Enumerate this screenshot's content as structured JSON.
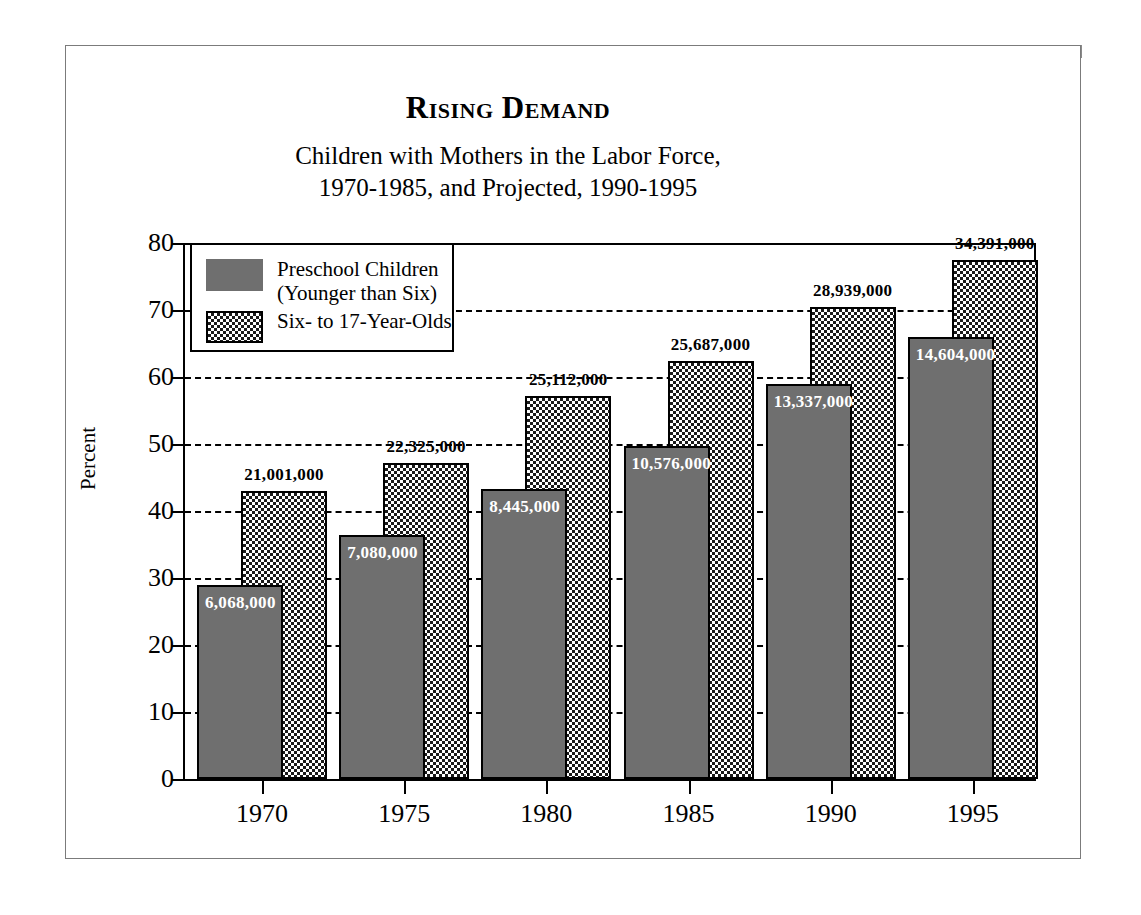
{
  "header": {
    "title": "Rising Demand",
    "subtitle_line1": "Children with Mothers in the Labor Force,",
    "subtitle_line2": "1970-1985, and Projected, 1990-1995"
  },
  "legend": {
    "items": [
      {
        "label": "Preschool Children\n(Younger than Six)",
        "swatch": "solid-gray-swatch",
        "color": "#6f6f6f"
      },
      {
        "label": "Six- to 17-Year-Olds",
        "swatch": "checkered-swatch",
        "color": "#1a1a1a"
      }
    ]
  },
  "axes": {
    "ylabel": "Percent",
    "yticks": [
      "0",
      "10",
      "20",
      "30",
      "40",
      "50",
      "60",
      "70",
      "80"
    ],
    "xticks": [
      "1970",
      "1975",
      "1980",
      "1985",
      "1990",
      "1995"
    ]
  },
  "chart_data": {
    "type": "bar",
    "title": "Rising Demand",
    "subtitle": "Children with Mothers in the Labor Force, 1970-1985, and Projected, 1990-1995",
    "xlabel": "",
    "ylabel": "Percent",
    "ylim": [
      0,
      80
    ],
    "yticks": [
      0,
      10,
      20,
      30,
      40,
      50,
      60,
      70,
      80
    ],
    "grid": true,
    "legend_position": "inside-top-left",
    "categories": [
      "1970",
      "1975",
      "1980",
      "1985",
      "1990",
      "1995"
    ],
    "series": [
      {
        "name": "Preschool Children (Younger than Six)",
        "style": "solid-gray",
        "color": "#6f6f6f",
        "values": [
          29.0,
          36.4,
          43.3,
          49.7,
          59.0,
          66.0
        ],
        "labels": [
          "6,068,000",
          "7,080,000",
          "8,445,000",
          "10,576,000",
          "13,337,000",
          "14,604,000"
        ],
        "label_position": "inside-top",
        "label_color": "#ffffff"
      },
      {
        "name": "Six- to 17-Year-Olds",
        "style": "checkered",
        "color": "#1a1a1a",
        "values": [
          43.0,
          47.1,
          57.2,
          62.4,
          70.4,
          77.5
        ],
        "labels": [
          "21,001,000",
          "22,325,000",
          "25,112,000",
          "25,687,000",
          "28,939,000",
          "34,391,000"
        ],
        "label_position": "above",
        "label_color": "#000000"
      }
    ]
  }
}
